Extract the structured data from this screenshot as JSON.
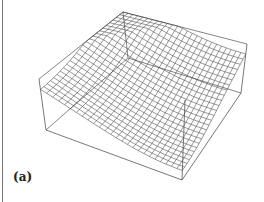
{
  "figure": {
    "panel_label": "(a)"
  },
  "chart_data": {
    "type": "surface3d",
    "title": "",
    "panel_label": "(a)",
    "grid": {
      "nx": 25,
      "ny": 25
    },
    "x_range": [
      -1,
      1
    ],
    "y_range": [
      -1,
      1
    ],
    "z_range": [
      0,
      1
    ],
    "xlabel": "",
    "ylabel": "",
    "zlabel": "",
    "ticks_shown": false,
    "box": true,
    "colors": {
      "mesh": "#333333",
      "box": "#555555"
    }
  }
}
